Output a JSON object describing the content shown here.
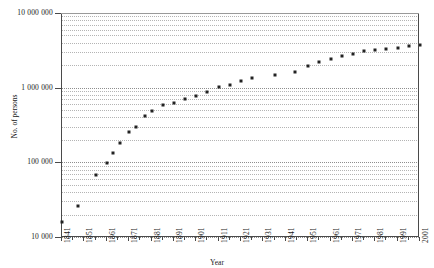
{
  "chart_data": {
    "type": "scatter",
    "title": "",
    "xlabel": "Year",
    "ylabel": "No. of persons",
    "yscale": "log",
    "ylim": [
      10000,
      10000000
    ],
    "xlim": [
      1841,
      2001
    ],
    "grid": "dotted-log-minor",
    "legend": "none",
    "marker": "square",
    "marker_color": "#222222",
    "y_tick_labels": [
      "10 000 000",
      "1 000 000",
      "100 000",
      "10 000"
    ],
    "y_tick_values": [
      10000000,
      1000000,
      100000,
      10000
    ],
    "x_tick_labels": [
      "1841",
      "1851",
      "1861",
      "1871",
      "1881",
      "1891",
      "1901",
      "1911",
      "1921",
      "1931",
      "1941",
      "1951",
      "1961",
      "1971",
      "1981",
      "1991",
      "2001"
    ],
    "x_tick_values": [
      1841,
      1851,
      1861,
      1871,
      1881,
      1891,
      1901,
      1911,
      1921,
      1931,
      1941,
      1951,
      1961,
      1971,
      1981,
      1991,
      2001
    ],
    "x": [
      1841,
      1848,
      1856,
      1861,
      1864,
      1867,
      1871,
      1874,
      1878,
      1881,
      1886,
      1891,
      1896,
      1901,
      1906,
      1911,
      1916,
      1921,
      1926,
      1936,
      1945,
      1951,
      1956,
      1961,
      1966,
      1971,
      1976,
      1981,
      1986,
      1991,
      1996,
      2001
    ],
    "values": [
      16000,
      26000,
      68000,
      99000,
      135000,
      184000,
      256000,
      300000,
      414000,
      490000,
      578000,
      627000,
      703000,
      773000,
      888000,
      1008000,
      1099000,
      1218000,
      1344000,
      1491000,
      1602000,
      1940000,
      2174000,
      2415000,
      2677000,
      2862000,
      3129000,
      3175000,
      3263000,
      3435000,
      3618000,
      3737000
    ],
    "series_name": "Population"
  },
  "axes": {
    "y_title": "No. of persons",
    "x_title": "Year"
  }
}
